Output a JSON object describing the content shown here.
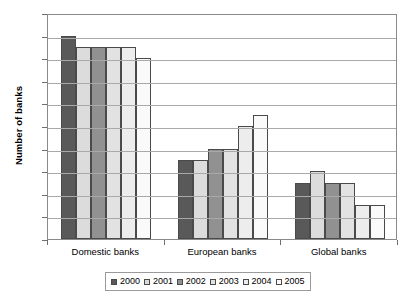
{
  "chart_data": {
    "type": "bar",
    "title": "",
    "xlabel": "",
    "ylabel": "Number of banks",
    "ylim": [
      0,
      20
    ],
    "ytick_step": 2,
    "grid": true,
    "legend_position": "bottom",
    "categories": [
      "Domestic banks",
      "European banks",
      "Global banks"
    ],
    "series": [
      {
        "name": "2000",
        "color": "#595959",
        "values": [
          18,
          7,
          5
        ]
      },
      {
        "name": "2001",
        "color": "#dcdcdc",
        "values": [
          17,
          7,
          6
        ]
      },
      {
        "name": "2002",
        "color": "#919191",
        "values": [
          17,
          8,
          5
        ]
      },
      {
        "name": "2003",
        "color": "#e2e2e2",
        "values": [
          17,
          8,
          5
        ]
      },
      {
        "name": "2004",
        "color": "#ededed",
        "values": [
          17,
          10,
          3
        ]
      },
      {
        "name": "2005",
        "color": "#fafafa",
        "values": [
          16,
          11,
          3
        ]
      }
    ],
    "ytick_labels": [
      "0",
      "2",
      "4",
      "6",
      "8",
      "10",
      "12",
      "14",
      "16",
      "18",
      "20"
    ]
  },
  "axis": {
    "y_title": "Number of banks"
  },
  "legend": {
    "entries": [
      {
        "label": "2000"
      },
      {
        "label": "2001"
      },
      {
        "label": "2002"
      },
      {
        "label": "2003"
      },
      {
        "label": "2004"
      },
      {
        "label": "2005"
      }
    ]
  }
}
